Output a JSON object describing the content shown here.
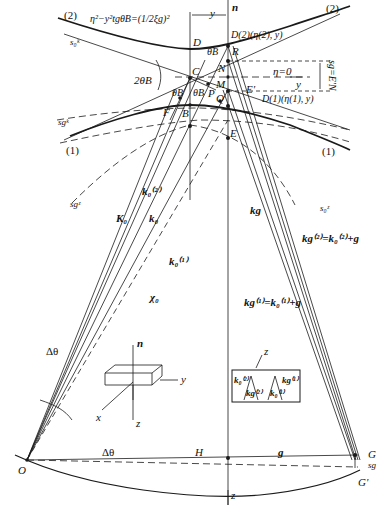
{
  "diagram": {
    "type": "dispersion-surface-ewald-construction",
    "branches": {
      "branch_2": "(2)",
      "branch_1_left": "(1)",
      "branch_1_right": "(1)",
      "branch_2_right": "(2)"
    },
    "equation": "η²−y²tgθB=(1/2ξg)²",
    "points": {
      "D": "D",
      "D2": "D(2)(η(2), y)",
      "R": "R",
      "C": "C",
      "N": "N",
      "M": "M",
      "P": "P",
      "E_prime": "E'",
      "Q": "Q",
      "D1": "D(1)(η(1), y)",
      "F": "F",
      "B": "B",
      "E": "E",
      "O": "O",
      "H": "H",
      "G": "G",
      "G_prime": "G'"
    },
    "axes": {
      "n": "n",
      "y_top": "y",
      "eta_zero": "η=0",
      "y_axis": "y",
      "z_bottom": "z"
    },
    "angles": {
      "two_theta_b": "2θB",
      "theta_b_top": "θB",
      "theta_b_left": "θB",
      "theta_b_right": "θB",
      "delta_theta_left": "Δθ",
      "delta_theta_bottom": "Δθ"
    },
    "spheres": {
      "s0k_top": "s₀ᵏ",
      "sgk": "sgᵏ",
      "sgz": "sgᶻ",
      "s0z": "s₀ᶻ"
    },
    "vectors": {
      "K0": "K₀",
      "k0_2": "k₀⁽²⁾",
      "k0": "k₀",
      "k0_1": "k₀⁽¹⁾",
      "chi0": "χ₀",
      "kg": "kg",
      "kg2_eq": "kg⁽²⁾=k₀⁽²⁾+g",
      "kg1_eq": "kg⁽¹⁾=k₀⁽¹⁾+g",
      "g": "g"
    },
    "dimension": {
      "sg_eq": "sg=E'N",
      "sg": "sg"
    },
    "crystal_inset": {
      "n": "n",
      "y": "y",
      "x": "x",
      "z": "z"
    },
    "beam_inset": {
      "z": "z",
      "k0_2": "k₀⁽²⁾",
      "kg_2": "kg⁽²⁾",
      "k0_1": "k₀⁽¹⁾",
      "kg_1": "kg⁽¹⁾"
    },
    "colors": {
      "line": "#1a1a1a",
      "background": "#ffffff"
    }
  }
}
